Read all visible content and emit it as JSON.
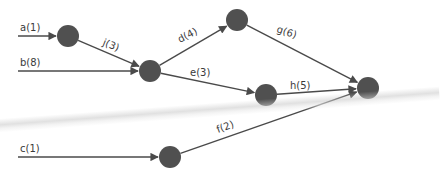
{
  "colors": {
    "node": "#505050",
    "edge": "#4a4a4a",
    "label": "#3a3a3a",
    "background": "#ffffff"
  },
  "nodes": [
    {
      "id": "n1",
      "x": 68,
      "y": 36,
      "r": 11
    },
    {
      "id": "n2",
      "x": 150,
      "y": 71,
      "r": 11
    },
    {
      "id": "n3",
      "x": 237,
      "y": 20,
      "r": 11
    },
    {
      "id": "n4",
      "x": 266,
      "y": 95,
      "r": 11
    },
    {
      "id": "n5",
      "x": 368,
      "y": 88,
      "r": 11
    },
    {
      "id": "n6",
      "x": 170,
      "y": 157,
      "r": 11
    }
  ],
  "edges": [
    {
      "label": "a(1)",
      "from": [
        18,
        36
      ],
      "to": "n1",
      "lx": 20,
      "ly": 31,
      "rot": 0
    },
    {
      "label": "b(8)",
      "from": [
        18,
        71
      ],
      "to": "n2",
      "lx": 20,
      "ly": 66,
      "rot": 0
    },
    {
      "label": "j(3)",
      "from": "n1",
      "to": "n2",
      "lx": 102,
      "ly": 45,
      "rot": 22
    },
    {
      "label": "d(4)",
      "from": "n2",
      "to": "n3",
      "lx": 180,
      "ly": 43,
      "rot": -28
    },
    {
      "label": "e(3)",
      "from": "n2",
      "to": "n4",
      "lx": 190,
      "ly": 76,
      "rot": 0
    },
    {
      "label": "g(6)",
      "from": "n3",
      "to": "n5",
      "lx": 276,
      "ly": 32,
      "rot": 18
    },
    {
      "label": "h(5)",
      "from": "n4",
      "to": "n5",
      "lx": 290,
      "ly": 89,
      "rot": 0
    },
    {
      "label": "c(1)",
      "from": [
        18,
        157
      ],
      "to": "n6",
      "lx": 20,
      "ly": 152,
      "rot": 0
    },
    {
      "label": "f(2)",
      "from": "n6",
      "to": "n5",
      "lx": 218,
      "ly": 133,
      "rot": -20
    }
  ],
  "crease": {
    "top": 120,
    "angle": -4.2
  }
}
